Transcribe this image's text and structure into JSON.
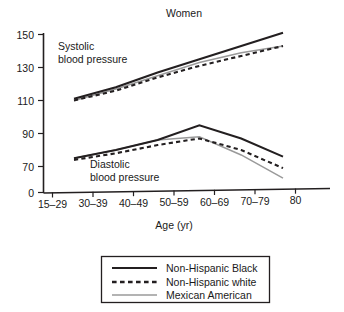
{
  "chart_data": {
    "type": "line",
    "title": "Women",
    "xlabel": "Age (yr)",
    "ylabel": "",
    "categories": [
      "15–29",
      "30–39",
      "40–49",
      "50–59",
      "60–69",
      "70–79",
      "80"
    ],
    "ytick_labels": [
      "0",
      "70",
      "90",
      "110",
      "130",
      "150"
    ],
    "ylim": [
      0,
      150
    ],
    "grid": false,
    "axis_break": true,
    "legend_position": "below-plot",
    "annotations": [
      {
        "name": "systolic-annotation",
        "line1": "Systolic",
        "line2": "blood pressure"
      },
      {
        "name": "diastolic-annotation",
        "line1": "Diastolic",
        "line2": "blood pressure"
      }
    ],
    "series": [
      {
        "name": "Non-Hispanic Black",
        "color": "#231f20",
        "style": "solid",
        "measures": [
          {
            "measure": "Systolic blood pressure",
            "x": [
              "15–29",
              "30–39",
              "40–49",
              "50–59",
              "60–69",
              "70–79"
            ],
            "values": [
              111,
              118,
              127,
              135,
              143,
              151
            ]
          },
          {
            "measure": "Diastolic blood pressure",
            "x": [
              "15–29",
              "30–39",
              "40–49",
              "50–59",
              "60–69",
              "70–79"
            ],
            "values": [
              75,
              80,
              86,
              95,
              87,
              76
            ]
          }
        ]
      },
      {
        "name": "Non-Hispanic white",
        "color": "#231f20",
        "style": "dashed",
        "measures": [
          {
            "measure": "Systolic blood pressure",
            "x": [
              "15–29",
              "30–39",
              "40–49",
              "50–59",
              "60–69",
              "70–79"
            ],
            "values": [
              110,
              116,
              124,
              131,
              137,
              143
            ]
          },
          {
            "measure": "Diastolic blood pressure",
            "x": [
              "15–29",
              "30–39",
              "40–49",
              "50–59",
              "60–69",
              "70–79"
            ],
            "values": [
              74,
              78,
              83,
              87,
              80,
              69
            ]
          }
        ]
      },
      {
        "name": "Mexican American",
        "color": "#9a9a9a",
        "style": "solid",
        "measures": [
          {
            "measure": "Systolic blood pressure",
            "x": [
              "15–29",
              "30–39",
              "40–49",
              "50–59",
              "60–69",
              "70–79"
            ],
            "values": [
              110,
              117,
              125,
              133,
              139,
              143
            ]
          },
          {
            "measure": "Diastolic blood pressure",
            "x": [
              "15–29",
              "30–39",
              "40–49",
              "50–59",
              "60–69",
              "70–79"
            ],
            "values": [
              75,
              80,
              86,
              88,
              77,
              63
            ]
          }
        ]
      }
    ]
  },
  "legend": {
    "items": [
      {
        "label": "Non-Hispanic Black",
        "swatch": "solid-black-line-swatch"
      },
      {
        "label": "Non-Hispanic white",
        "swatch": "dashed-black-line-swatch"
      },
      {
        "label": "Mexican American",
        "swatch": "solid-gray-line-swatch"
      }
    ]
  },
  "axis": {
    "y_ticks": [
      "150",
      "130",
      "110",
      "90",
      "70",
      "0"
    ],
    "x_ticks": [
      "15–29",
      "30–39",
      "40–49",
      "50–59",
      "60–69",
      "70–79",
      "80"
    ],
    "x_title": "Age (yr)"
  },
  "colors": {
    "ink": "#231f20",
    "gray_series": "#9a9a9a",
    "background": "#ffffff"
  }
}
